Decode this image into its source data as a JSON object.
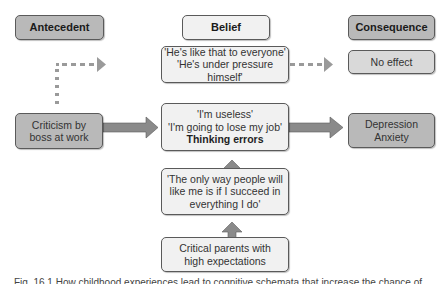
{
  "headers": {
    "antecedent": "Antecedent",
    "belief": "Belief",
    "consequence": "Consequence"
  },
  "nodes": {
    "alt_belief": {
      "line1": "'He's like that to everyone'",
      "line2": "'He's under pressure himself'"
    },
    "no_effect": "No effect",
    "criticism": {
      "line1": "Criticism by",
      "line2": "boss at work"
    },
    "belief_main": {
      "line1": "'I'm useless'",
      "line2": "'I'm going to lose my job'",
      "line3": "Thinking errors"
    },
    "depression": {
      "line1": "Depression",
      "line2": "Anxiety"
    },
    "core_belief": {
      "line1": "'The only way people will",
      "line2": "like me is if I succeed in",
      "line3": "everything I do'"
    },
    "parents": {
      "line1": "Critical parents with",
      "line2": "high expectations"
    }
  },
  "edges": [
    {
      "from": "criticism",
      "to": "alt_belief",
      "style": "dotted"
    },
    {
      "from": "alt_belief",
      "to": "no_effect",
      "style": "dotted"
    },
    {
      "from": "criticism",
      "to": "belief_main",
      "style": "solid"
    },
    {
      "from": "belief_main",
      "to": "depression",
      "style": "solid"
    },
    {
      "from": "core_belief",
      "to": "belief_main",
      "style": "solid"
    },
    {
      "from": "parents",
      "to": "core_belief",
      "style": "solid"
    }
  ],
  "caption": "Fig. 16.1 How childhood experiences lead to cognitive schemata that increase the chance of"
}
